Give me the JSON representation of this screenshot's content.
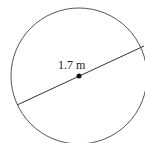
{
  "diagram": {
    "shape": "circle",
    "diameter_label": "1.7 m",
    "colors": {
      "stroke": "#555555",
      "background": "#ffffff",
      "center": "#111111"
    },
    "circle": {
      "cx": 79,
      "cy": 76,
      "r": 68
    },
    "diameter": {
      "x1": 17,
      "y1": 105,
      "x2": 144,
      "y2": 46
    }
  }
}
